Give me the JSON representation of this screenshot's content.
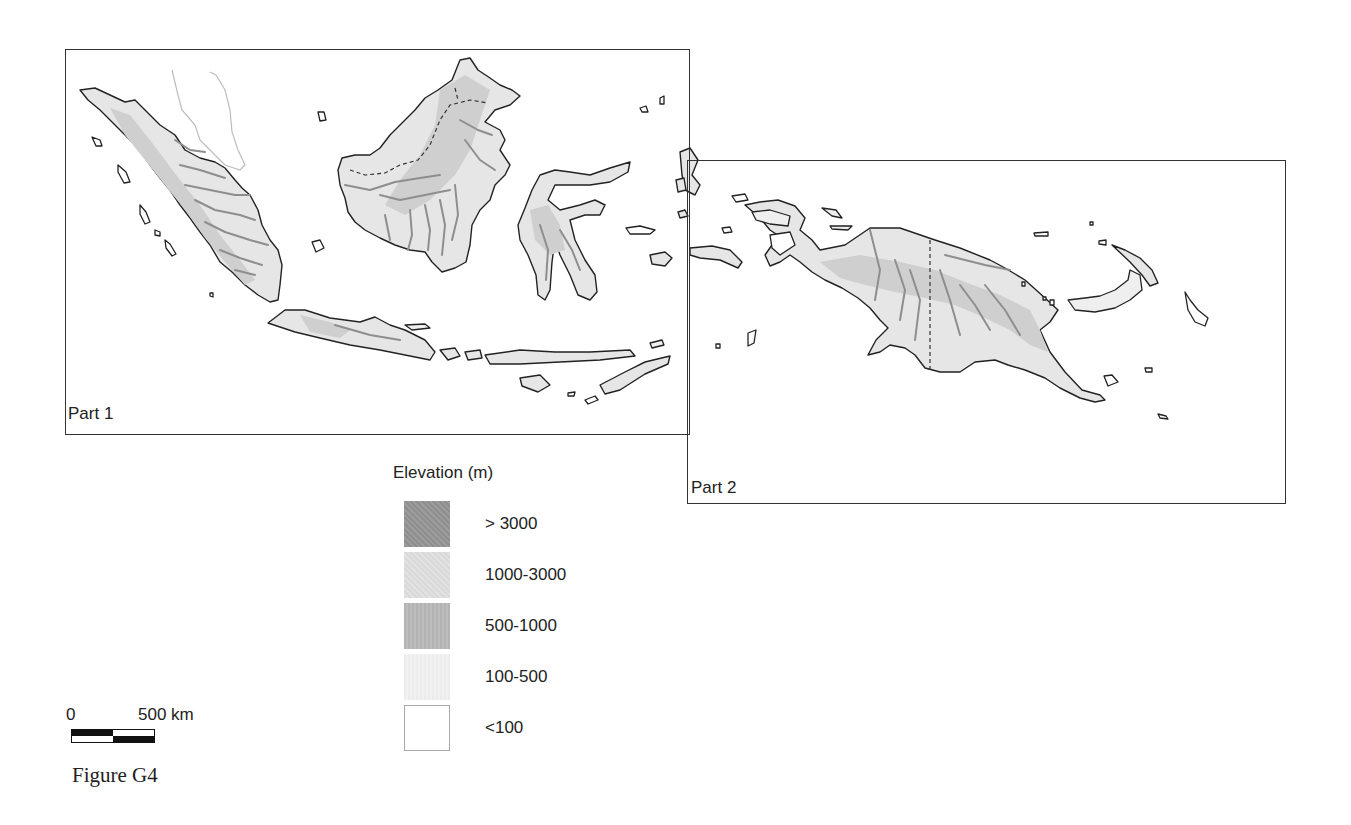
{
  "figure": {
    "caption": "Figure G4",
    "parts": [
      {
        "label": "Part 1",
        "region": "Western Indonesia (Sumatra, Borneo, Java, Sulawesi, Lesser Sunda Islands)"
      },
      {
        "label": "Part 2",
        "region": "New Guinea (Papua and Papua New Guinea)"
      }
    ]
  },
  "legend": {
    "title": "Elevation (m)",
    "items": [
      {
        "label": "> 3000",
        "color": "#959595"
      },
      {
        "label": "1000-3000",
        "color": "#dddddd"
      },
      {
        "label": "500-1000",
        "color": "#b8b8b8"
      },
      {
        "label": "100-500",
        "color": "#efefef"
      },
      {
        "label": "<100",
        "color": "#ffffff"
      }
    ]
  },
  "scale": {
    "start_label": "0",
    "end_label": "500 km"
  }
}
